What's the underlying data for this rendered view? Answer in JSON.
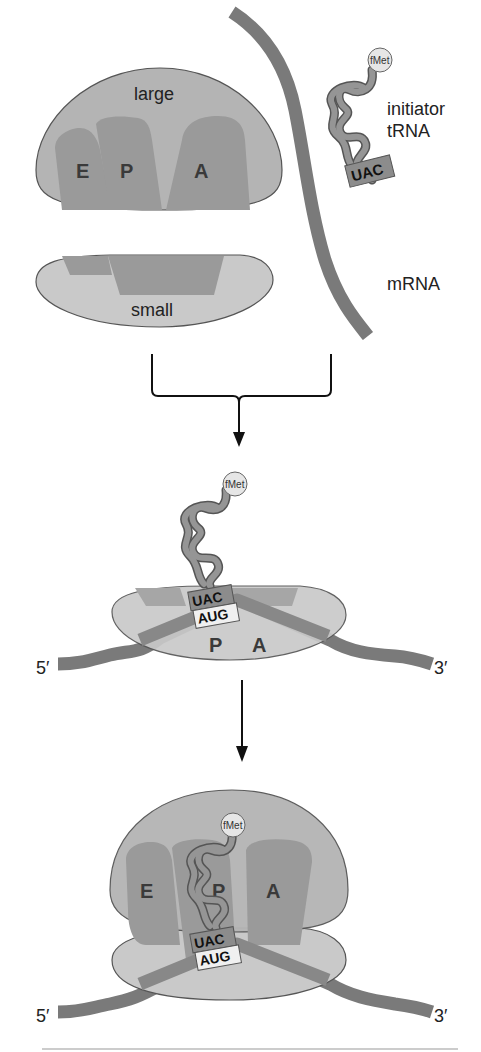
{
  "diagram": {
    "stage1": {
      "large_subunit_label": "large",
      "small_subunit_label": "small",
      "sites": [
        "E",
        "P",
        "A"
      ],
      "trna_label_line1": "initiator",
      "trna_label_line2": "tRNA",
      "mrna_label": "mRNA",
      "fmet": "fMet",
      "anticodon": "UAC"
    },
    "stage2": {
      "fmet": "fMet",
      "anticodon": "UAC",
      "codon": "AUG",
      "sites": [
        "P",
        "A"
      ],
      "five_prime": "5′",
      "three_prime": "3′"
    },
    "stage3": {
      "fmet": "fMet",
      "anticodon": "UAC",
      "codon": "AUG",
      "sites": [
        "E",
        "P",
        "A"
      ],
      "five_prime": "5′",
      "three_prime": "3′"
    },
    "colors": {
      "large_subunit": "#b4b4b4",
      "small_subunit": "#c9c9c9",
      "mrna": "#7a7a7a",
      "trna": "#8c8c8c",
      "fmet": "#e6e6e6"
    }
  }
}
